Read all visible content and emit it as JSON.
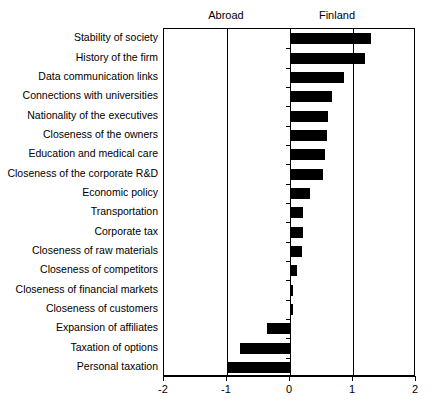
{
  "headers": {
    "left": "Abroad",
    "right": "Finland"
  },
  "chart_data": {
    "type": "bar",
    "orientation": "horizontal",
    "title": "",
    "subtitle": "",
    "xlabel": "",
    "ylabel": "",
    "xlim": [
      -2,
      2
    ],
    "xticks": [
      -2,
      -1,
      0,
      1,
      2
    ],
    "xtick_labels": [
      "-2",
      "-1",
      "0",
      "1",
      "2"
    ],
    "grid": false,
    "gridlines_at": [
      -1,
      0,
      1
    ],
    "legend": "none",
    "side_labels": {
      "negative": "Abroad",
      "positive": "Finland"
    },
    "bar_color": "#000000",
    "categories": [
      "Stability of society",
      "History of the firm",
      "Data communication links",
      "Connections with universities",
      "Nationality of the executives",
      "Closeness of the owners",
      "Education and medical care",
      "Closeness of the corporate R&D",
      "Economic policy",
      "Transportation",
      "Corporate tax",
      "Closeness of raw materials",
      "Closeness of competitors",
      "Closeness of financial markets",
      "Closeness of customers",
      "Expansion of affiliates",
      "Taxation of options",
      "Personal taxation"
    ],
    "values": [
      1.28,
      1.19,
      0.86,
      0.67,
      0.61,
      0.58,
      0.55,
      0.53,
      0.31,
      0.2,
      0.2,
      0.19,
      0.11,
      0.05,
      0.04,
      -0.36,
      -0.79,
      -1.0
    ]
  }
}
